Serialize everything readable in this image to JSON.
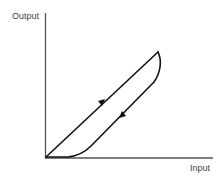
{
  "diagram": {
    "type": "hysteresis-loop",
    "y_axis_label": "Output",
    "x_axis_label": "Input",
    "colors": {
      "axis": "#555555",
      "curve": "#111111",
      "text": "#444444",
      "background": "#ffffff"
    },
    "curves": [
      {
        "name": "increasing-input-path",
        "direction": "up",
        "arrow_icon": "arrow-up-right-icon"
      },
      {
        "name": "decreasing-input-path",
        "direction": "down",
        "arrow_icon": "arrow-down-left-icon"
      }
    ]
  }
}
